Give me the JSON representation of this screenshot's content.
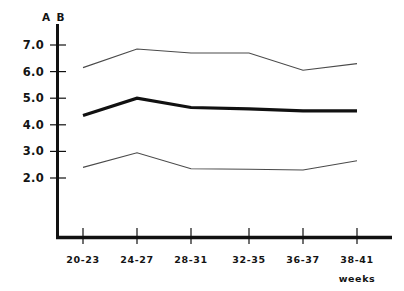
{
  "chart_data": {
    "type": "line",
    "title": "",
    "subtitle": "",
    "xlabel": "weeks",
    "ylabel": "A B",
    "corner_label": "A B",
    "categories": [
      "20-23",
      "24-27",
      "28-31",
      "32-35",
      "36-37",
      "38-41"
    ],
    "x": [
      1,
      2,
      3,
      4,
      5,
      6
    ],
    "ylim": [
      0,
      7.6
    ],
    "yticks": [
      2.0,
      3.0,
      4.0,
      5.0,
      6.0,
      7.0
    ],
    "ytick_labels": [
      "2.0",
      "3.0",
      "4.0",
      "5.0",
      "6.0",
      "7.0"
    ],
    "grid": false,
    "legend": null,
    "legend_position": "none",
    "series": [
      {
        "name": "upper",
        "style": "thin",
        "color": "#4a4a4a",
        "values": [
          6.15,
          6.85,
          6.7,
          6.7,
          6.05,
          6.3
        ]
      },
      {
        "name": "mean",
        "style": "bold",
        "color": "#111111",
        "values": [
          4.35,
          5.0,
          4.65,
          4.6,
          4.52,
          4.52
        ]
      },
      {
        "name": "lower",
        "style": "thin",
        "color": "#4a4a4a",
        "values": [
          2.4,
          2.95,
          2.35,
          2.33,
          2.3,
          2.65
        ]
      }
    ],
    "annotations": []
  },
  "axes": {
    "y_axis_name": "y-axis",
    "x_axis_name": "x-axis"
  }
}
